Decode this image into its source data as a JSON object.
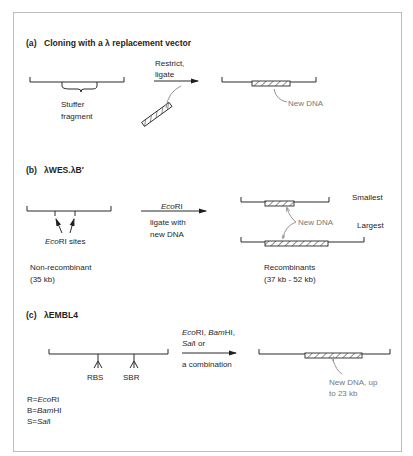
{
  "figure": {
    "border_color": "#bdbdbd",
    "panels": [
      {
        "id": "a",
        "label": "(a)",
        "title": "Cloning with a λ replacement vector",
        "left_labels": {
          "stuffer_line1": "Stuffer",
          "stuffer_line2": "fragment"
        },
        "arrow_labels": {
          "line1": "Restrict,",
          "line2": "ligate"
        },
        "right_labels": {
          "new_dna": "New DNA"
        }
      },
      {
        "id": "b",
        "label": "(b)",
        "title": "λWES.λB′",
        "left_labels": {
          "sites_italic": "Eco",
          "sites_rest": "RI sites",
          "name": "Non-recombinant",
          "size": "(35 kb)"
        },
        "arrow_labels": {
          "enzyme_italic": "Eco",
          "enzyme_rest": "RI",
          "line1": "ligate with",
          "line2": "new DNA"
        },
        "right_labels": {
          "smallest": "Smallest",
          "largest": "Largest",
          "new_dna": "New DNA",
          "name": "Recombinants",
          "size": "(37 kb - 52 kb)"
        }
      },
      {
        "id": "c",
        "label": "(c)",
        "title": "λEMBL4",
        "left_labels": {
          "site1": "RBS",
          "site2": "SBR",
          "key": [
            {
              "prefix": "R=",
              "italic": "Eco",
              "rest": "RI"
            },
            {
              "prefix": "B=",
              "italic": "Bam",
              "rest": "HI"
            },
            {
              "prefix": "S=",
              "italic": "Sal",
              "rest": "I"
            }
          ]
        },
        "arrow_labels": {
          "line1_a_italic": "Eco",
          "line1_a_rest": "RI, ",
          "line1_b_italic": "Bam",
          "line1_b_rest": "HI,",
          "line2_italic": "Sal",
          "line2_rest": "I or",
          "line3": "a combination"
        },
        "right_labels": {
          "new_dna_line1": "New DNA, up",
          "new_dna_line2": "to 23 kb"
        }
      }
    ]
  }
}
